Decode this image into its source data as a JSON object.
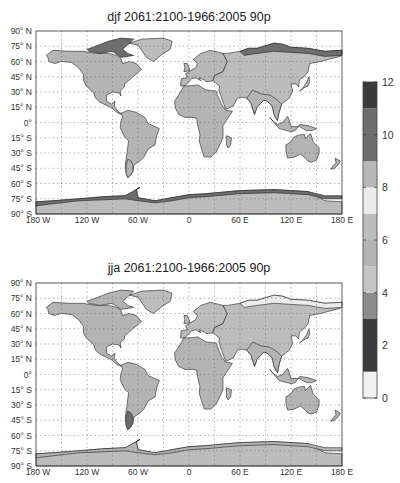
{
  "figure": {
    "panels": [
      {
        "id": "djf",
        "title": "djf 2061:2100-1966:2005 90p",
        "season": "djf",
        "region_values": {
          "north_america": 5.5,
          "canada_arctic": 10.5,
          "greenland": 6.0,
          "south_america": 5.5,
          "europe": 8.5,
          "asia": 6.0,
          "siberia_north": 10.0,
          "africa": 5.5,
          "australia": 5.5,
          "india_se_asia": 5.5,
          "antarctica_coast": 10.5,
          "antarctica_interior": 6.5
        }
      },
      {
        "id": "jja",
        "title": "jja 2061:2100-1966:2005 90p",
        "season": "jja",
        "region_values": {
          "north_america": 5.5,
          "canada_arctic": 5.5,
          "greenland": 6.0,
          "south_america": 5.5,
          "patagonia": 10.5,
          "europe": 6.5,
          "asia": 6.5,
          "siberia_north": 7.5,
          "africa": 5.5,
          "australia": 5.5,
          "india_se_asia": 5.5,
          "antarctica_coast": 5.5,
          "antarctica_interior": 6.5
        }
      }
    ],
    "lat_ticks": [
      "90° N",
      "75° N",
      "60° N",
      "45° N",
      "30° N",
      "15° N",
      "0°",
      "15° S",
      "30° S",
      "45° S",
      "60° S",
      "75° S",
      "90° S"
    ],
    "lon_ticks": [
      "180 W",
      "120 W",
      "60 W",
      "0",
      "60 E",
      "120 E",
      "180 E"
    ],
    "colorbar": {
      "min": 0,
      "max": 12,
      "tick_labels": [
        "0",
        "2",
        "4",
        "6",
        "8",
        "10",
        "12"
      ],
      "bands": [
        {
          "from": 0,
          "to": 1,
          "color": "#f2f2f2"
        },
        {
          "from": 1,
          "to": 3,
          "color": "#3c3c3c"
        },
        {
          "from": 3,
          "to": 4,
          "color": "#8c8c8c"
        },
        {
          "from": 4,
          "to": 5,
          "color": "#c4c4c4"
        },
        {
          "from": 5,
          "to": 6,
          "color": "#b4b4b4"
        },
        {
          "from": 6,
          "to": 7,
          "color": "#bcbcbc"
        },
        {
          "from": 7,
          "to": 8,
          "color": "#ececec"
        },
        {
          "from": 8,
          "to": 9,
          "color": "#b8b8b8"
        },
        {
          "from": 9,
          "to": 11,
          "color": "#6e6e6e"
        },
        {
          "from": 11,
          "to": 12,
          "color": "#3a3a3a"
        }
      ]
    }
  }
}
